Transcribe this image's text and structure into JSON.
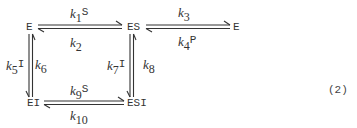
{
  "diagram": {
    "type": "kinetic-scheme",
    "nodes": {
      "E_left": "E",
      "ES": "ES",
      "E_right": "E",
      "EI": "EI",
      "ESI": "ESI"
    },
    "rates": {
      "k1": {
        "k": "k",
        "sub": "1",
        "species": "S"
      },
      "k2": {
        "k": "k",
        "sub": "2",
        "species": ""
      },
      "k3": {
        "k": "k",
        "sub": "3",
        "species": ""
      },
      "k4": {
        "k": "k",
        "sub": "4",
        "species": "P"
      },
      "k5": {
        "k": "k",
        "sub": "5",
        "species": "I"
      },
      "k6": {
        "k": "k",
        "sub": "6",
        "species": ""
      },
      "k7": {
        "k": "k",
        "sub": "7",
        "species": "I"
      },
      "k8": {
        "k": "k",
        "sub": "8",
        "species": ""
      },
      "k9": {
        "k": "k",
        "sub": "9",
        "species": "S"
      },
      "k10": {
        "k": "k",
        "sub": "10",
        "species": ""
      }
    },
    "equation_number": "(2)"
  }
}
